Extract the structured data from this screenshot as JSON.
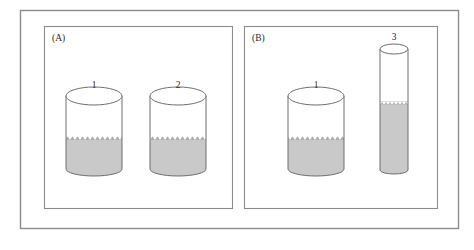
{
  "figure": {
    "background_color": "#ffffff",
    "outer_frame": {
      "name": "outer-frame",
      "x": 20,
      "y": 10,
      "width": 438,
      "height": 218,
      "stroke": "#8c8c8c",
      "stroke_width": 1.4,
      "fill": "none"
    },
    "liquid_color": "#c9c9c9",
    "liquid_surface_color": "#b4b4b4",
    "vessel_stroke": "#6e6e6e",
    "vessel_fill": "#ffffff",
    "panels": [
      {
        "id": "panel-a",
        "label": "(A)",
        "label_x": 52,
        "label_y": 41,
        "frame": {
          "x": 44,
          "y": 26,
          "width": 188,
          "height": 182
        },
        "vessels": [
          {
            "id": "vessel-a-1",
            "label": "1",
            "label_x": 94,
            "label_y": 88,
            "shape": "short-wide-cylinder",
            "cx": 94,
            "top_y": 96,
            "bottom_y": 176,
            "half_width": 28,
            "rim_ry": 9,
            "base_ry": 7,
            "liquid_top_y": 140,
            "fill_fraction": 0.45
          },
          {
            "id": "vessel-a-2",
            "label": "2",
            "label_x": 178,
            "label_y": 88,
            "shape": "short-wide-cylinder",
            "cx": 178,
            "top_y": 96,
            "bottom_y": 176,
            "half_width": 28,
            "rim_ry": 9,
            "base_ry": 7,
            "liquid_top_y": 140,
            "fill_fraction": 0.45
          }
        ]
      },
      {
        "id": "panel-b",
        "label": "(B)",
        "label_x": 252,
        "label_y": 41,
        "frame": {
          "x": 244,
          "y": 26,
          "width": 193,
          "height": 182
        },
        "vessels": [
          {
            "id": "vessel-b-1",
            "label": "1",
            "label_x": 316,
            "label_y": 88,
            "shape": "short-wide-cylinder",
            "cx": 316,
            "top_y": 96,
            "bottom_y": 176,
            "half_width": 28,
            "rim_ry": 9,
            "base_ry": 7,
            "liquid_top_y": 140,
            "fill_fraction": 0.45
          },
          {
            "id": "vessel-b-3",
            "label": "3",
            "label_x": 394,
            "label_y": 40,
            "shape": "tall-narrow-cylinder",
            "cx": 394,
            "top_y": 49,
            "bottom_y": 174,
            "half_width": 14,
            "rim_ry": 5,
            "base_ry": 4,
            "liquid_top_y": 104,
            "fill_fraction": 0.56
          }
        ]
      }
    ]
  }
}
